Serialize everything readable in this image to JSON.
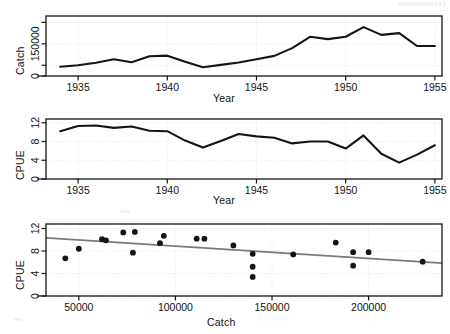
{
  "figure": {
    "background": "#ffffff",
    "ink": "#141414",
    "fit_line_color": "#7a7a7a",
    "grid_color": "#e8e8e8",
    "corner_mark": "101"
  },
  "panels": [
    {
      "name": "catch-vs-year",
      "ylabel": "Catch",
      "xlabel": "Year"
    },
    {
      "name": "cpue-vs-year",
      "ylabel": "CPUE",
      "xlabel": "Year"
    },
    {
      "name": "cpue-vs-catch",
      "ylabel": "CPUE",
      "xlabel": "Catch"
    }
  ],
  "chart_data": [
    {
      "type": "line",
      "title": "",
      "xlabel": "Year",
      "ylabel": "Catch",
      "xlim": [
        1933.2,
        1955.4
      ],
      "ylim": [
        0,
        280000
      ],
      "xticks": [
        1935,
        1940,
        1945,
        1950,
        1955
      ],
      "xticklabels": [
        "1935",
        "1940",
        "1945",
        "1950",
        "1955"
      ],
      "yticks": [
        0,
        50000,
        150000,
        250000
      ],
      "yticklabels": [
        "0",
        "",
        "150000",
        ""
      ],
      "grid": true,
      "x": [
        1934,
        1935,
        1936,
        1937,
        1938,
        1939,
        1940,
        1941,
        1942,
        1943,
        1944,
        1945,
        1946,
        1947,
        1948,
        1949,
        1950,
        1951,
        1952,
        1953,
        1954,
        1955
      ],
      "values": [
        43000,
        50000,
        62000,
        78000,
        64000,
        92000,
        95000,
        67000,
        41000,
        52000,
        63000,
        78000,
        94000,
        130000,
        183000,
        172000,
        183000,
        228000,
        192000,
        200000,
        140000,
        140000
      ]
    },
    {
      "type": "line",
      "title": "",
      "xlabel": "Year",
      "ylabel": "CPUE",
      "xlim": [
        1933.2,
        1955.4
      ],
      "ylim": [
        0,
        12.8
      ],
      "xticks": [
        1935,
        1940,
        1945,
        1950,
        1955
      ],
      "xticklabels": [
        "1935",
        "1940",
        "1945",
        "1950",
        "1955"
      ],
      "yticks": [
        0,
        4,
        8,
        12
      ],
      "yticklabels": [
        "0",
        "4",
        "8",
        "12"
      ],
      "grid": true,
      "x": [
        1934,
        1935,
        1936,
        1937,
        1938,
        1939,
        1940,
        1941,
        1942,
        1943,
        1944,
        1945,
        1946,
        1947,
        1948,
        1949,
        1950,
        1951,
        1952,
        1953,
        1954,
        1955
      ],
      "values": [
        10.2,
        11.3,
        11.4,
        10.9,
        11.2,
        10.3,
        10.2,
        8.2,
        6.7,
        8.1,
        9.6,
        9.1,
        8.8,
        7.6,
        8.0,
        8.0,
        6.5,
        9.3,
        5.4,
        3.5,
        5.2,
        7.2
      ]
    },
    {
      "type": "scatter",
      "title": "",
      "xlabel": "Catch",
      "ylabel": "CPUE",
      "xlim": [
        33000,
        238000
      ],
      "ylim": [
        0,
        12.8
      ],
      "xticks": [
        50000,
        100000,
        150000,
        200000
      ],
      "xticklabels": [
        "50000",
        "100000",
        "150000",
        "200000"
      ],
      "yticks": [
        0,
        4,
        8,
        12
      ],
      "yticklabels": [
        "0",
        "4",
        "8",
        "12"
      ],
      "grid": true,
      "x": [
        43000,
        50000,
        62000,
        64000,
        73000,
        78000,
        79000,
        92000,
        94000,
        111000,
        115000,
        130000,
        140000,
        140000,
        140000,
        161000,
        183000,
        192000,
        192000,
        200000,
        228000
      ],
      "y": [
        6.7,
        8.4,
        10.1,
        9.9,
        11.3,
        7.7,
        11.4,
        9.4,
        10.7,
        10.2,
        10.2,
        9.0,
        7.5,
        5.2,
        3.4,
        7.4,
        9.5,
        7.8,
        5.4,
        7.8,
        6.1
      ],
      "fit_line": {
        "name": "linear fit",
        "x": [
          33000,
          238000
        ],
        "y": [
          10.35,
          5.85
        ]
      }
    }
  ]
}
